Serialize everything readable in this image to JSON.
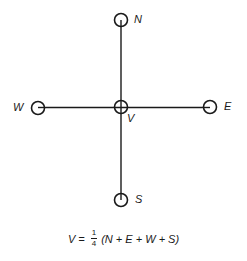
{
  "diagram": {
    "type": "five-point stencil",
    "colors": {
      "stroke": "#1a1a1a",
      "background": "#ffffff"
    },
    "nodes": [
      {
        "id": "N",
        "label": "N",
        "x": 121,
        "y": 20
      },
      {
        "id": "W",
        "label": "W",
        "x": 38,
        "y": 108
      },
      {
        "id": "V",
        "label": "V",
        "x": 121,
        "y": 107
      },
      {
        "id": "E",
        "label": "E",
        "x": 210,
        "y": 107
      },
      {
        "id": "S",
        "label": "S",
        "x": 121,
        "y": 200
      }
    ],
    "edges": [
      {
        "from": "N",
        "to": "S",
        "orientation": "vertical"
      },
      {
        "from": "W",
        "to": "E",
        "orientation": "horizontal"
      }
    ]
  },
  "labels": {
    "N": "N",
    "W": "W",
    "V": "V",
    "E": "E",
    "S": "S"
  },
  "formula": {
    "lhs": "V =",
    "fraction_numerator": "1",
    "fraction_denominator": "4",
    "rhs": "(N + E + W + S)"
  }
}
